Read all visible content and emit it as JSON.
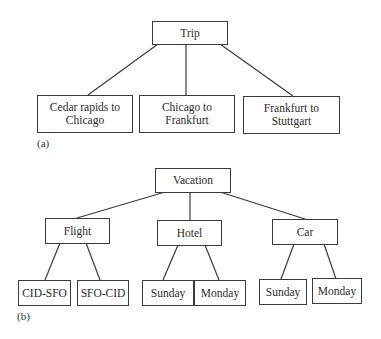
{
  "diagram_a": {
    "caption": "(a)",
    "root": "Trip",
    "children": [
      "Cedar rapids to Chicago",
      "Chicago to Frankfurt",
      "Frankfurt to Stuttgart"
    ],
    "children_lines": [
      [
        "Cedar rapids to",
        "Chicago"
      ],
      [
        "Chicago to",
        "Frankfurt"
      ],
      [
        "Frankfurt to",
        "Stuttgart"
      ]
    ]
  },
  "diagram_b": {
    "caption": "(b)",
    "root": "Vacation",
    "children": [
      {
        "label": "Flight",
        "children": [
          "CID-SFO",
          "SFO-CID"
        ]
      },
      {
        "label": "Hotel",
        "children": [
          "Sunday",
          "Monday"
        ]
      },
      {
        "label": "Car",
        "children": [
          "Sunday",
          "Monday"
        ]
      }
    ]
  }
}
